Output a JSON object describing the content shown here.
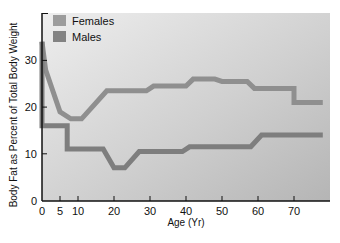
{
  "chart_data": {
    "type": "line",
    "title": "",
    "xlabel": "Age (Yr)",
    "ylabel": "Body Fat as Percent of Total Body Weight",
    "xlim": [
      0,
      80
    ],
    "ylim": [
      0,
      35
    ],
    "x_ticks": [
      0,
      5,
      10,
      20,
      30,
      40,
      50,
      60,
      70
    ],
    "y_ticks": [
      0,
      10,
      20,
      30
    ],
    "grid": false,
    "legend_position": "top-left",
    "series": [
      {
        "name": "Females",
        "color": "#8f8f8f",
        "points": [
          [
            0,
            34
          ],
          [
            1,
            28
          ],
          [
            5,
            19
          ],
          [
            8,
            17.5
          ],
          [
            11,
            17.5
          ],
          [
            18,
            23.5
          ],
          [
            29,
            23.5
          ],
          [
            31,
            24.5
          ],
          [
            40,
            24.5
          ],
          [
            42,
            26
          ],
          [
            48,
            26
          ],
          [
            50,
            25.5
          ],
          [
            57,
            25.5
          ],
          [
            59,
            24
          ],
          [
            70,
            24
          ],
          [
            70,
            21
          ],
          [
            78,
            21
          ]
        ]
      },
      {
        "name": "Males",
        "color": "#7e7e7e",
        "points": [
          [
            0,
            34
          ],
          [
            0,
            16
          ],
          [
            7,
            16
          ],
          [
            7,
            11
          ],
          [
            17,
            11
          ],
          [
            20,
            7
          ],
          [
            23,
            7
          ],
          [
            27,
            10.5
          ],
          [
            39,
            10.5
          ],
          [
            41,
            11.5
          ],
          [
            58,
            11.5
          ],
          [
            61,
            14
          ],
          [
            78,
            14
          ]
        ]
      }
    ]
  },
  "legend": {
    "females_label": "Females",
    "males_label": "Males"
  },
  "axes": {
    "x_label": "Age (Yr)",
    "y_label": "Body Fat as Percent of Total Body Weight",
    "x_tick_labels": [
      "0",
      "5",
      "10",
      "20",
      "30",
      "40",
      "50",
      "60",
      "70"
    ],
    "y_tick_labels": [
      "0",
      "10",
      "20",
      "30"
    ]
  },
  "colors": {
    "plot_bg_top": "#ececec",
    "plot_bg_bottom": "#b9b9b9",
    "female_line": "#8f8f8f",
    "male_line": "#7e7e7e",
    "female_swatch": "#9c9c9c",
    "male_swatch": "#838383"
  }
}
